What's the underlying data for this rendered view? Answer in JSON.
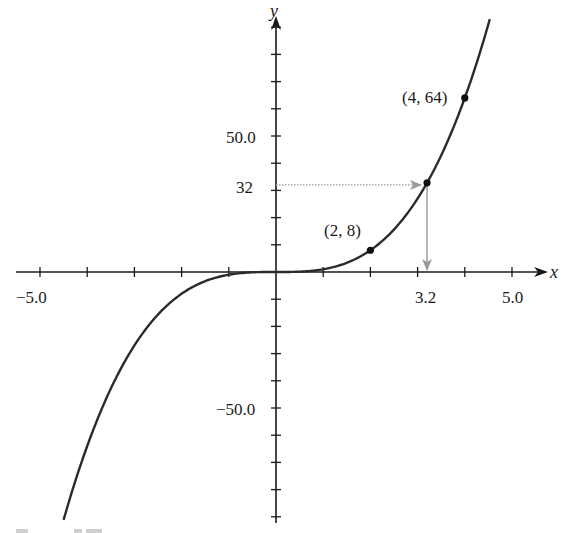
{
  "chart_data": {
    "type": "line",
    "title": "",
    "function": "y = x^3",
    "xlabel": "x",
    "ylabel": "y",
    "xlim": [
      -5.5,
      5.8
    ],
    "ylim": [
      -95,
      100
    ],
    "x_tick_step": 1,
    "y_tick_step": 10,
    "x_tick_labels": [
      {
        "value": -5.0,
        "label": "−5.0"
      },
      {
        "value": 3.2,
        "label": "3.2"
      },
      {
        "value": 5.0,
        "label": "5.0"
      }
    ],
    "y_tick_labels": [
      {
        "value": 50.0,
        "label": "50.0"
      },
      {
        "value": 32,
        "label": "32"
      },
      {
        "value": -50.0,
        "label": "−50.0"
      }
    ],
    "grid": false,
    "legend": null,
    "series": [
      {
        "name": "y = x^3",
        "x_range": [
          -4.5,
          4.53
        ],
        "color": "#2b2b2b"
      }
    ],
    "points": [
      {
        "x": 2,
        "y": 8,
        "label": "(2, 8)"
      },
      {
        "x": 3.2,
        "y": 32.768,
        "label": ""
      },
      {
        "x": 4,
        "y": 64,
        "label": "(4, 64)"
      }
    ],
    "annotations": [
      {
        "type": "arrow",
        "from": [
          0,
          32
        ],
        "to": [
          3.2,
          32
        ],
        "style": "dotted",
        "color": "#999999"
      },
      {
        "type": "arrow",
        "from": [
          3.2,
          32.768
        ],
        "to": [
          3.2,
          0
        ],
        "style": "solid",
        "color": "#999999"
      }
    ]
  },
  "layout": {
    "origin_px": [
      276,
      272
    ],
    "px_per_x": 47.2,
    "px_per_y": 2.72
  },
  "labels": {
    "x_axis": "x",
    "y_axis": "y",
    "point_2_8": "(2, 8)",
    "point_4_64": "(4, 64)",
    "x_neg5": "−5.0",
    "x_3_2": "3.2",
    "x_5": "5.0",
    "y_50": "50.0",
    "y_32": "32",
    "y_neg50": "−50.0"
  }
}
